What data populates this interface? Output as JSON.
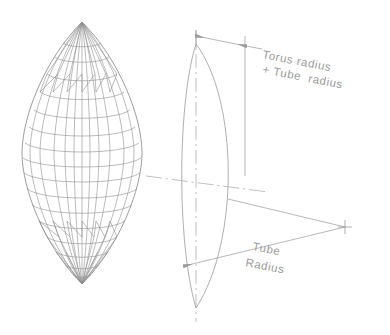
{
  "drawing": {
    "title": "Torus surface-of-revolution wireframe with section dimensions",
    "background_color": "#ffffff",
    "line_color": "#9a9a9a",
    "mesh_color": "#8e8e8e",
    "text_color": "#9a9a9a",
    "annotations": [
      {
        "id": "torus-plus-tube-radius",
        "line1": "Torus radius",
        "line2": "+ Tube  radius",
        "rotation_deg": 11,
        "x": 262,
        "y": 58
      },
      {
        "id": "tube-radius",
        "line1": "Tube",
        "line2": "Radius",
        "rotation_deg": 11,
        "x": 252,
        "y": 250
      }
    ],
    "dimensions": [
      {
        "id": "overall-radius-dimension",
        "label_ref": "torus-plus-tube-radius",
        "arrow_style": "double",
        "from_x": 196,
        "from_y": 36,
        "to_x": 246,
        "to_y": 46
      },
      {
        "id": "tube-radius-dimension",
        "label_ref": "tube-radius",
        "arrow_style": "single",
        "from_x": 345,
        "from_y": 227,
        "to_x": 184,
        "to_y": 266
      }
    ],
    "markers": [
      {
        "id": "center-crosshair",
        "x": 345,
        "y": 227,
        "size": 7
      }
    ],
    "views": [
      {
        "id": "wireframe-view",
        "label": "3D wireframe lens solid",
        "cx": 82,
        "cy": 172
      },
      {
        "id": "section-view",
        "label": "2D profile section",
        "cx": 210,
        "cy": 172
      }
    ],
    "mesh": {
      "longitude_count": 12,
      "latitude_count": 20,
      "top_vertex": {
        "x": 82,
        "y": 22
      },
      "bottom_vertex": {
        "x": 82,
        "y": 284
      },
      "half_width": 60
    }
  }
}
